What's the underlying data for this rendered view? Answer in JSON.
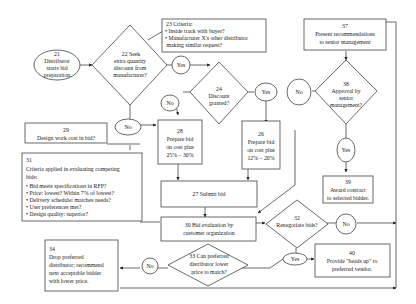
{
  "diagram": {
    "type": "flowchart",
    "colors": {
      "stroke": "#444444",
      "fill": "#ffffff",
      "text": "#1a1a1a"
    },
    "nodes": {
      "n21": {
        "id": "21",
        "shape": "ellipse",
        "lines": [
          "21",
          "Distributor",
          "starts bid",
          "preparation"
        ]
      },
      "n22": {
        "id": "22",
        "shape": "diamond",
        "lines": [
          "22   Seek",
          "extra quantity",
          "discount from",
          "manufacturer?"
        ]
      },
      "n23": {
        "id": "23",
        "shape": "note",
        "title": "23          Criteria:",
        "lines": [
          "• Inside track with buyer?",
          "• Manufacturer X's other distributor",
          "   making similar request?"
        ]
      },
      "n24": {
        "id": "24",
        "shape": "diamond",
        "lines": [
          "24",
          "Discount",
          "granted?"
        ]
      },
      "n26": {
        "id": "26",
        "shape": "rect",
        "lines": [
          "26",
          "Prepare bid",
          "on cost plus",
          "12% – 20%"
        ]
      },
      "n27": {
        "id": "27",
        "shape": "rect",
        "lines": [
          "27   Submit bid"
        ]
      },
      "n28": {
        "id": "28",
        "shape": "rect",
        "lines": [
          "28",
          "Prepare bid",
          "on cost plus",
          "25% – 30%"
        ]
      },
      "n29": {
        "id": "29",
        "shape": "rect",
        "lines": [
          "29",
          "Design work cost in bid?"
        ]
      },
      "n30": {
        "id": "30",
        "shape": "rect",
        "lines": [
          "30  Bid evaluation by",
          "customer organization"
        ]
      },
      "n31": {
        "id": "31",
        "shape": "note",
        "lines": [
          "31",
          "Criteria applied in evaluating competing",
          "bids:",
          "• Bid meets specifications in RFP?",
          "• Price: lowest? Within 7% of lowest?",
          "• Delivery schedule: matches needs?",
          "• User preferences met?",
          "• Design quality: superior?"
        ]
      },
      "n32": {
        "id": "32",
        "shape": "diamond",
        "lines": [
          "32",
          "Renegotiate bids?"
        ]
      },
      "n33": {
        "id": "33",
        "shape": "diamond",
        "lines": [
          "33 Can preferred",
          "distributor lower",
          "price to match?"
        ]
      },
      "n34": {
        "id": "34",
        "shape": "rect",
        "lines": [
          "34",
          "Drop preferred",
          "distributor;  recommend",
          "next acceptable bidder",
          "with lower price."
        ]
      },
      "n37": {
        "id": "37",
        "shape": "rect",
        "lines": [
          "37",
          "Present recommendations",
          "to senior management"
        ]
      },
      "n38": {
        "id": "38",
        "shape": "diamond",
        "lines": [
          "38",
          "Approval by",
          "senior",
          "management?"
        ]
      },
      "n39": {
        "id": "39",
        "shape": "rect",
        "lines": [
          "39",
          "Award contract",
          "to selected bidder."
        ]
      },
      "n40": {
        "id": "40",
        "shape": "rect",
        "lines": [
          "40",
          "Provide \"heads up\" to",
          "preferred vendor."
        ]
      }
    },
    "labels": {
      "yes": "Yes",
      "no": "No"
    }
  }
}
